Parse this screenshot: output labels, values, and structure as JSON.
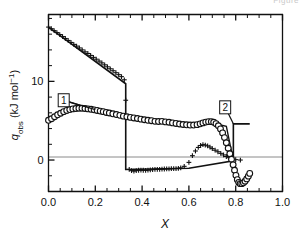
{
  "figure": {
    "clipped_header_text": "Figure",
    "background": "#ffffff",
    "ink_color": "#111111",
    "zero_line_color": "#808080"
  },
  "chart_data": {
    "type": "scatter",
    "title": "",
    "xlabel": "X",
    "ylabel": "q_obs (kJ mol⁻¹)",
    "ylabel_parts": {
      "symbol": "q",
      "subscript": "obs",
      "units": " (kJ mol",
      "exponent": "−1",
      "close": ")"
    },
    "xlim": [
      0.0,
      1.0
    ],
    "ylim": [
      -4.0,
      18.5
    ],
    "grid": false,
    "legend_position": "none",
    "x_ticks_major": [
      0.0,
      0.2,
      0.4,
      0.6,
      0.8,
      1.0
    ],
    "x_tick_labels": [
      "0.0",
      "0.2",
      "0.4",
      "0.6",
      "0.8",
      "1.0"
    ],
    "x_ticks_minor": [
      0.05,
      0.1,
      0.15,
      0.25,
      0.3,
      0.35,
      0.45,
      0.5,
      0.55,
      0.65,
      0.7,
      0.75,
      0.85,
      0.9,
      0.95
    ],
    "y_ticks_major": [
      0,
      10
    ],
    "y_tick_labels": [
      "0",
      "10"
    ],
    "y_ticks_minor": [
      -2,
      2,
      4,
      6,
      8,
      12,
      14,
      16,
      18
    ],
    "annotations": [
      {
        "name": "label-1",
        "text": "1",
        "x": 0.065,
        "y": 7.6,
        "leader_to_x": 0.2,
        "leader_to_y": 6.4
      },
      {
        "name": "label-2",
        "text": "2",
        "x": 0.755,
        "y": 6.7,
        "leader_to_x": 0.79,
        "leader_to_y": 4.6
      }
    ],
    "series": [
      {
        "name": "cross-series",
        "marker": "plus",
        "x": [
          0.0,
          0.012,
          0.024,
          0.036,
          0.048,
          0.06,
          0.072,
          0.084,
          0.096,
          0.108,
          0.12,
          0.132,
          0.144,
          0.156,
          0.168,
          0.18,
          0.192,
          0.204,
          0.216,
          0.228,
          0.24,
          0.252,
          0.264,
          0.276,
          0.288,
          0.3,
          0.312,
          0.324,
          0.33,
          0.345,
          0.355,
          0.365,
          0.375,
          0.385,
          0.395,
          0.405,
          0.415,
          0.425,
          0.435,
          0.445,
          0.455,
          0.465,
          0.475,
          0.485,
          0.495,
          0.505,
          0.515,
          0.525,
          0.535,
          0.545,
          0.555,
          0.565,
          0.58,
          0.6,
          0.615,
          0.628,
          0.64,
          0.65,
          0.66,
          0.67,
          0.68,
          0.69,
          0.7,
          0.712,
          0.724,
          0.736,
          0.748,
          0.76,
          0.772,
          0.784,
          0.8,
          0.82
        ],
        "y": [
          16.9,
          16.7,
          16.45,
          16.2,
          15.95,
          15.7,
          15.45,
          15.2,
          14.95,
          14.7,
          14.48,
          14.25,
          14.0,
          13.75,
          13.55,
          13.3,
          13.05,
          12.82,
          12.58,
          12.35,
          12.1,
          11.85,
          11.6,
          11.35,
          11.1,
          10.85,
          10.6,
          10.2,
          7.6,
          -1.2,
          -1.35,
          -1.4,
          -1.35,
          -1.3,
          -1.28,
          -1.3,
          -1.32,
          -1.28,
          -1.25,
          -1.22,
          -1.2,
          -1.18,
          -1.18,
          -1.16,
          -1.14,
          -1.12,
          -1.12,
          -1.1,
          -1.08,
          -1.08,
          -1.05,
          -1.0,
          -0.8,
          -0.3,
          0.55,
          1.15,
          1.6,
          1.85,
          1.95,
          1.9,
          1.8,
          1.65,
          1.45,
          1.25,
          1.05,
          0.85,
          0.65,
          0.45,
          0.3,
          0.15,
          0.05,
          0.0
        ]
      },
      {
        "name": "circle-series",
        "marker": "open-circle",
        "x": [
          0.0,
          0.013,
          0.026,
          0.039,
          0.052,
          0.065,
          0.078,
          0.091,
          0.104,
          0.117,
          0.13,
          0.143,
          0.156,
          0.169,
          0.182,
          0.195,
          0.208,
          0.221,
          0.234,
          0.247,
          0.26,
          0.275,
          0.29,
          0.305,
          0.32,
          0.335,
          0.35,
          0.365,
          0.38,
          0.395,
          0.41,
          0.425,
          0.44,
          0.455,
          0.47,
          0.485,
          0.5,
          0.515,
          0.53,
          0.545,
          0.56,
          0.575,
          0.59,
          0.605,
          0.62,
          0.635,
          0.648,
          0.66,
          0.672,
          0.684,
          0.696,
          0.706,
          0.716,
          0.726,
          0.735,
          0.744,
          0.752,
          0.76,
          0.768,
          0.775,
          0.782,
          0.789,
          0.795,
          0.801,
          0.807,
          0.813,
          0.819,
          0.826,
          0.833,
          0.84,
          0.847,
          0.854,
          0.86
        ],
        "y": [
          5.05,
          5.25,
          5.5,
          5.75,
          5.95,
          6.15,
          6.3,
          6.42,
          6.5,
          6.55,
          6.58,
          6.58,
          6.55,
          6.5,
          6.45,
          6.38,
          6.3,
          6.22,
          6.15,
          6.05,
          5.98,
          5.88,
          5.78,
          5.68,
          5.58,
          5.5,
          5.42,
          5.35,
          5.28,
          5.2,
          5.12,
          5.05,
          5.0,
          4.92,
          4.9,
          4.92,
          4.85,
          4.8,
          4.72,
          4.65,
          4.58,
          4.52,
          4.48,
          4.45,
          4.45,
          4.5,
          4.6,
          4.72,
          4.82,
          4.88,
          4.88,
          4.8,
          4.62,
          4.35,
          3.95,
          3.45,
          2.85,
          2.2,
          1.5,
          0.8,
          0.1,
          -0.6,
          -1.3,
          -1.95,
          -2.5,
          -2.85,
          -3.0,
          -3.0,
          -2.9,
          -2.7,
          -2.4,
          -2.05,
          -1.7
        ]
      },
      {
        "name": "step-line-fit",
        "marker": "line",
        "description": "piecewise model curve: upper branch, vertical drop at x=0.33, lower branch, second vertical drop at x=0.79",
        "x": [
          0.0,
          0.33,
          0.33,
          0.6,
          0.79,
          0.79,
          0.86
        ],
        "y": [
          16.9,
          9.7,
          -1.2,
          -1.05,
          -0.1,
          4.6,
          4.6
        ]
      },
      {
        "name": "lower-fit-line",
        "marker": "line",
        "description": "smooth fit through circle series from x=0.07 to x=0.79 then vertical to -0.1",
        "x": [
          0.065,
          0.2,
          0.4,
          0.6,
          0.7,
          0.76,
          0.79
        ],
        "y": [
          7.6,
          6.35,
          5.2,
          4.5,
          4.7,
          4.3,
          -0.1
        ]
      }
    ]
  }
}
